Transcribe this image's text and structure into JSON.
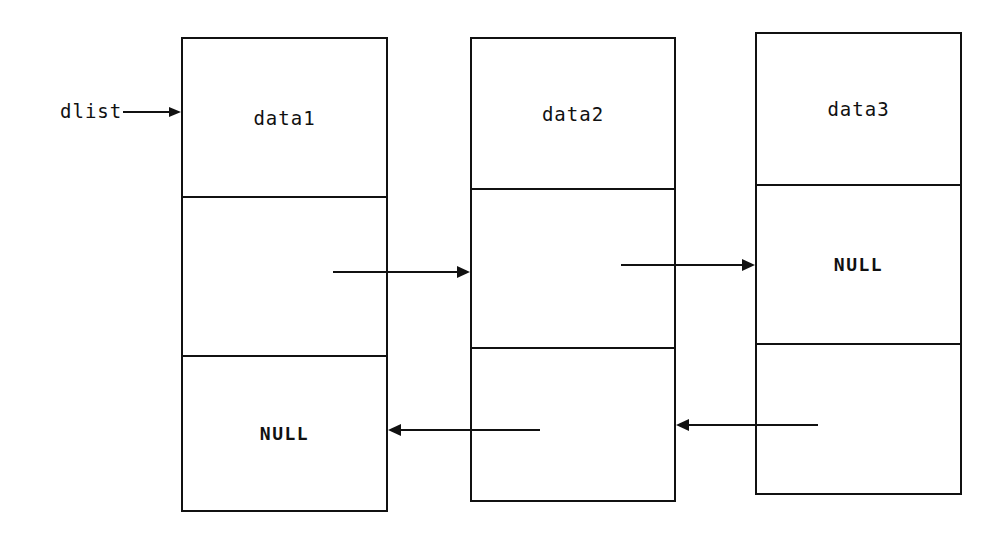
{
  "diagram": {
    "background_color": "#ffffff",
    "stroke_color": "#111111",
    "head_pointer": {
      "label": "dlist",
      "x": 60,
      "y": 100,
      "arrow": {
        "x1": 123,
        "y1": 112,
        "x2": 181,
        "y2": 112
      }
    },
    "nodes": [
      {
        "name": "node-1",
        "x": 181,
        "y": 37,
        "width": 207,
        "height": 475,
        "dividers": [
          159,
          318
        ],
        "cells": [
          {
            "name": "data-cell",
            "label": "data1",
            "style": "plain"
          },
          {
            "name": "next-pointer-cell",
            "label": "",
            "style": "plain"
          },
          {
            "name": "prev-pointer-cell",
            "label": "NULL",
            "style": "null"
          }
        ]
      },
      {
        "name": "node-2",
        "x": 470,
        "y": 37,
        "width": 206,
        "height": 465,
        "dividers": [
          151,
          310
        ],
        "cells": [
          {
            "name": "data-cell",
            "label": "data2",
            "style": "plain"
          },
          {
            "name": "next-pointer-cell",
            "label": "",
            "style": "plain"
          },
          {
            "name": "prev-pointer-cell",
            "label": "",
            "style": "plain"
          }
        ]
      },
      {
        "name": "node-3",
        "x": 755,
        "y": 32,
        "width": 207,
        "height": 463,
        "dividers": [
          152,
          311
        ],
        "cells": [
          {
            "name": "data-cell",
            "label": "data3",
            "style": "plain"
          },
          {
            "name": "next-pointer-cell",
            "label": "NULL",
            "style": "null"
          },
          {
            "name": "prev-pointer-cell",
            "label": "",
            "style": "plain"
          }
        ]
      }
    ],
    "links": [
      {
        "name": "next-link-1-to-2",
        "kind": "next",
        "from_node": "node-1",
        "to_node": "node-2",
        "x1": 333,
        "y1": 272,
        "x2": 470,
        "y2": 272,
        "direction": "right"
      },
      {
        "name": "next-link-2-to-3",
        "kind": "next",
        "from_node": "node-2",
        "to_node": "node-3",
        "x1": 621,
        "y1": 265,
        "x2": 755,
        "y2": 265,
        "direction": "right"
      },
      {
        "name": "prev-link-2-to-1",
        "kind": "prev",
        "from_node": "node-2",
        "to_node": "node-1",
        "x1": 540,
        "y1": 430,
        "x2": 388,
        "y2": 430,
        "direction": "left"
      },
      {
        "name": "prev-link-3-to-2",
        "kind": "prev",
        "from_node": "node-3",
        "to_node": "node-2",
        "x1": 818,
        "y1": 425,
        "x2": 676,
        "y2": 425,
        "direction": "left"
      }
    ]
  }
}
